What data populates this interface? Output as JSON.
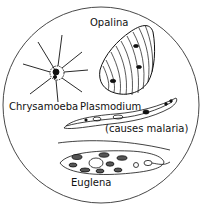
{
  "diagram": {
    "labels": {
      "opalina": "Opalina",
      "chrysamoeba": "Chrysamoeba",
      "plasmodium": "Plasmodium",
      "plasmodium_note": "(causes malaria)",
      "euglena": "Euglena"
    },
    "colors": {
      "ink": "#111111",
      "background": "#ffffff",
      "circle": "#333333"
    }
  }
}
